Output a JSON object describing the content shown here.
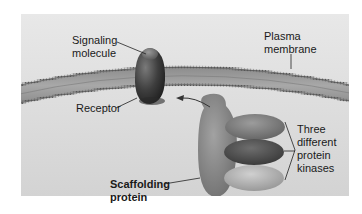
{
  "figure": {
    "labels": {
      "signaling_molecule": [
        "Signaling",
        "molecule"
      ],
      "plasma_membrane": [
        "Plasma",
        "membrane"
      ],
      "receptor": "Receptor",
      "scaffolding_protein": [
        "Scaffolding",
        "protein"
      ],
      "protein_kinases": [
        "Three",
        "different",
        "protein",
        "kinases"
      ]
    },
    "colors": {
      "panel_top": "#e6e6e6",
      "panel_bottom": "#d2d2d2",
      "membrane_fill": "#9a9a9a",
      "membrane_edge": "#5e5e5e",
      "receptor": "#3c3c3c",
      "scaffold": "#8a8a8a",
      "kinase_top": "#7e7e7e",
      "kinase_middle": "#505050",
      "kinase_bottom": "#b4b4b4"
    }
  }
}
